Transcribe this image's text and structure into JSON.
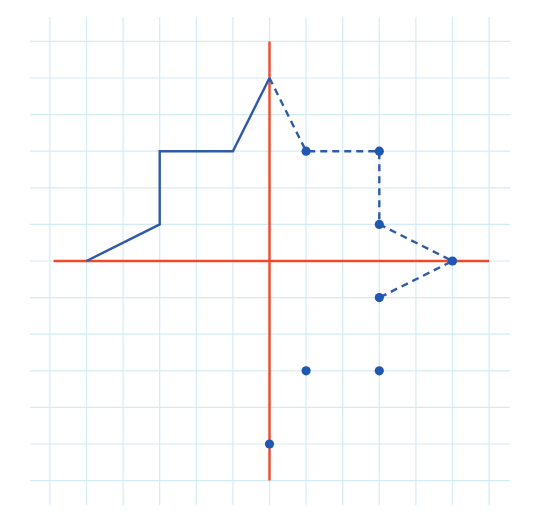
{
  "diagram": {
    "type": "coordinate-grid",
    "colors": {
      "background": "#ffffff",
      "grid": "#d3ecf4",
      "axis": "#ee4a2a",
      "shape": "#2f5aa8",
      "point": "#1f58b0"
    },
    "grid": {
      "origin_px": [
        269.5,
        261
      ],
      "unit_px": 36.6,
      "x_range": [
        -6,
        6
      ],
      "y_range": [
        -6,
        6
      ],
      "extent_px": {
        "left": 30,
        "right": 510,
        "top": 17,
        "bottom": 505
      }
    },
    "axes": {
      "x_axis": {
        "from": [
          -5.9,
          0
        ],
        "to": [
          6,
          0
        ]
      },
      "y_axis": {
        "from": [
          0,
          6
        ],
        "to": [
          0,
          -6
        ]
      }
    },
    "solid_polyline": {
      "label": "original half-figure",
      "points": [
        [
          -5,
          0
        ],
        [
          -3,
          1
        ],
        [
          -3,
          3
        ],
        [
          -1,
          3
        ],
        [
          0,
          5
        ]
      ]
    },
    "dashed_polyline": {
      "label": "reflected half-figure (partial)",
      "points": [
        [
          0,
          5
        ],
        [
          1,
          3
        ],
        [
          3,
          3
        ],
        [
          3,
          1
        ],
        [
          5,
          0
        ],
        [
          3,
          -1
        ]
      ]
    },
    "dashed_points": [
      [
        1,
        3
      ],
      [
        3,
        3
      ],
      [
        3,
        1
      ],
      [
        5,
        0
      ],
      [
        3,
        -1
      ]
    ],
    "isolated_points": [
      [
        1,
        -3
      ],
      [
        3,
        -3
      ],
      [
        0,
        -5
      ]
    ]
  }
}
